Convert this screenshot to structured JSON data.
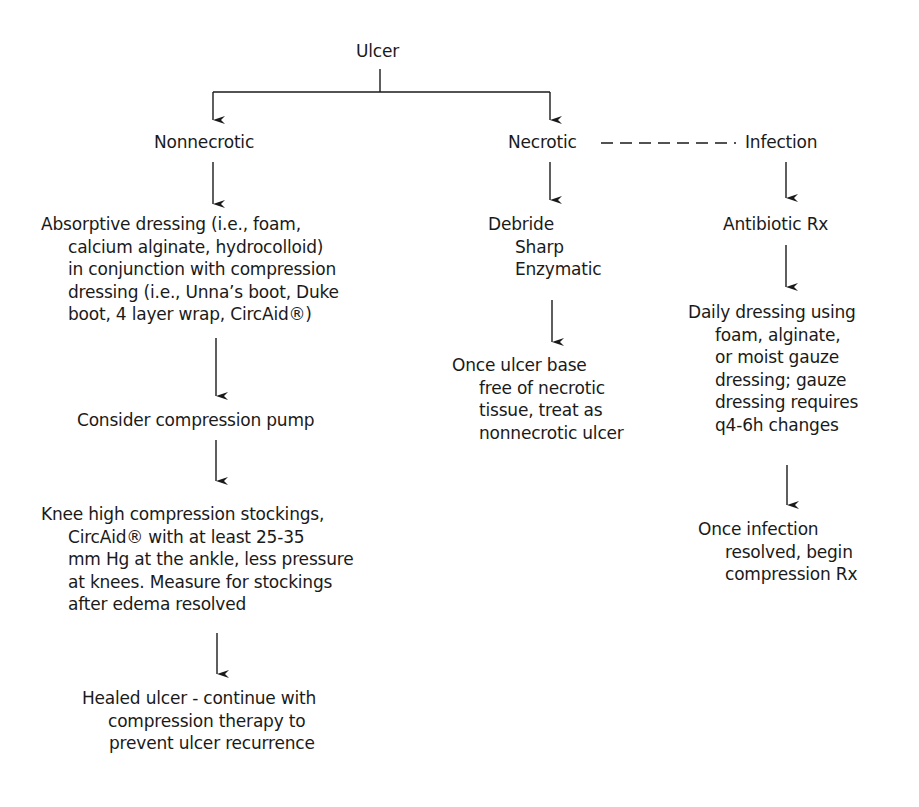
{
  "diagram": {
    "type": "flowchart",
    "root": {
      "label": "Ulcer"
    },
    "branches": {
      "nonnecrotic": {
        "label": "Nonnecrotic",
        "steps": [
          {
            "lines": [
              "Absorptive dressing (i.e., foam,",
              "calcium alginate, hydrocolloid)",
              "in conjunction with compression",
              "dressing (i.e., Unna’s boot, Duke",
              "boot, 4 layer wrap, CircAid®)"
            ]
          },
          {
            "lines": [
              "Consider compression pump"
            ]
          },
          {
            "lines": [
              "Knee high compression stockings,",
              "CircAid® with at least 25-35",
              "mm Hg at the ankle, less pressure",
              "at knees. Measure for stockings",
              "after edema resolved"
            ]
          },
          {
            "lines": [
              "Healed ulcer - continue with",
              "compression therapy to",
              "prevent ulcer recurrence"
            ]
          }
        ]
      },
      "necrotic": {
        "label": "Necrotic",
        "steps": [
          {
            "lines": [
              "Debride",
              "Sharp",
              "Enzymatic"
            ]
          },
          {
            "lines": [
              "Once ulcer base",
              "free of necrotic",
              "tissue, treat as",
              "nonnecrotic ulcer"
            ]
          }
        ]
      },
      "infection": {
        "label": "Infection",
        "link_from": "Necrotic",
        "link_style": "dashed",
        "steps": [
          {
            "lines": [
              "Antibiotic Rx"
            ]
          },
          {
            "lines": [
              "Daily dressing using",
              "foam, alginate,",
              "or moist gauze",
              "dressing; gauze",
              "dressing requires",
              "q4-6h changes"
            ]
          },
          {
            "lines": [
              "Once infection",
              "resolved, begin",
              "compression Rx"
            ]
          }
        ]
      }
    },
    "colors": {
      "ink": "#1a1a1a",
      "background": "#ffffff"
    }
  }
}
